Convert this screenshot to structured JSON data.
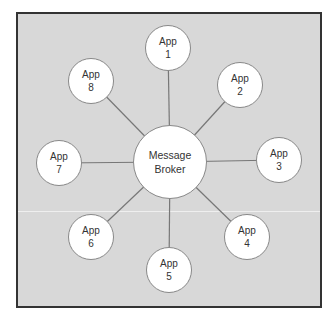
{
  "diagram": {
    "type": "hub-and-spoke",
    "colors": {
      "background": "#d8d8d8",
      "frame_border": "#333333",
      "node_fill": "#ffffff",
      "node_stroke": "#888888",
      "link": "#777777",
      "text": "#333333"
    },
    "hub": {
      "id": "broker",
      "line1": "Message",
      "line2": "Broker",
      "cx": 170,
      "cy": 162,
      "r": 37
    },
    "nodes": [
      {
        "id": "app1",
        "line1": "App",
        "line2": "1",
        "cx": 168,
        "cy": 48,
        "r": 23
      },
      {
        "id": "app2",
        "line1": "App",
        "line2": "2",
        "cx": 240,
        "cy": 85,
        "r": 23
      },
      {
        "id": "app3",
        "line1": "App",
        "line2": "3",
        "cx": 279,
        "cy": 160,
        "r": 23
      },
      {
        "id": "app4",
        "line1": "App",
        "line2": "4",
        "cx": 247,
        "cy": 237,
        "r": 23
      },
      {
        "id": "app5",
        "line1": "App",
        "line2": "5",
        "cx": 169,
        "cy": 270,
        "r": 23
      },
      {
        "id": "app6",
        "line1": "App",
        "line2": "6",
        "cx": 91,
        "cy": 237,
        "r": 23
      },
      {
        "id": "app7",
        "line1": "App",
        "line2": "7",
        "cx": 59,
        "cy": 163,
        "r": 23
      },
      {
        "id": "app8",
        "line1": "App",
        "line2": "8",
        "cx": 91,
        "cy": 81,
        "r": 23
      }
    ]
  }
}
